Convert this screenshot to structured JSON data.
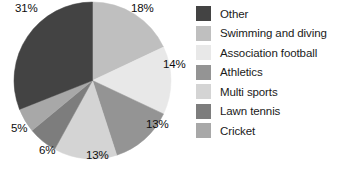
{
  "chart_data": {
    "type": "pie",
    "title": "",
    "xlabel": "",
    "ylabel": "",
    "legend_position": "right",
    "grid": false,
    "categories": [
      "Other",
      "Swimming and diving",
      "Association football",
      "Athletics",
      "Multi sports",
      "Lawn tennis",
      "Cricket"
    ],
    "values": [
      31,
      18,
      14,
      13,
      13,
      6,
      5
    ],
    "value_labels": [
      "31%",
      "18%",
      "14%",
      "13%",
      "13%",
      "6%",
      "5%"
    ],
    "colors": [
      "#434343",
      "#bfbfbf",
      "#e8e8e8",
      "#949494",
      "#d4d4d4",
      "#7d7d7d",
      "#a8a8a8"
    ],
    "slice_order_clockwise_from_top": [
      {
        "category": "Swimming and diving",
        "value": 18,
        "label": "18%",
        "color": "#bfbfbf"
      },
      {
        "category": "Association football",
        "value": 14,
        "label": "14%",
        "color": "#e8e8e8"
      },
      {
        "category": "Athletics",
        "value": 13,
        "label": "13%",
        "color": "#949494"
      },
      {
        "category": "Multi sports",
        "value": 13,
        "label": "13%",
        "color": "#d4d4d4"
      },
      {
        "category": "Lawn tennis",
        "value": 6,
        "label": "6%",
        "color": "#7d7d7d"
      },
      {
        "category": "Cricket",
        "value": 5,
        "label": "5%",
        "color": "#a8a8a8"
      },
      {
        "category": "Other",
        "value": 31,
        "label": "31%",
        "color": "#434343"
      }
    ]
  },
  "legend": {
    "items": [
      {
        "label": "Other",
        "color": "#434343"
      },
      {
        "label": "Swimming and diving",
        "color": "#bfbfbf"
      },
      {
        "label": "Association football",
        "color": "#e8e8e8"
      },
      {
        "label": "Athletics",
        "color": "#949494"
      },
      {
        "label": "Multi sports",
        "color": "#d4d4d4"
      },
      {
        "label": "Lawn tennis",
        "color": "#7d7d7d"
      },
      {
        "label": "Cricket",
        "color": "#a8a8a8"
      }
    ]
  },
  "slice_labels": [
    {
      "text": "18%",
      "left": 131,
      "top": 2
    },
    {
      "text": "14%",
      "left": 163,
      "top": 58
    },
    {
      "text": "13%",
      "left": 146,
      "top": 118
    },
    {
      "text": "13%",
      "left": 86,
      "top": 149
    },
    {
      "text": "6%",
      "left": 39,
      "top": 144
    },
    {
      "text": "5%",
      "left": 11,
      "top": 122
    },
    {
      "text": "31%",
      "left": 15,
      "top": 2
    }
  ]
}
